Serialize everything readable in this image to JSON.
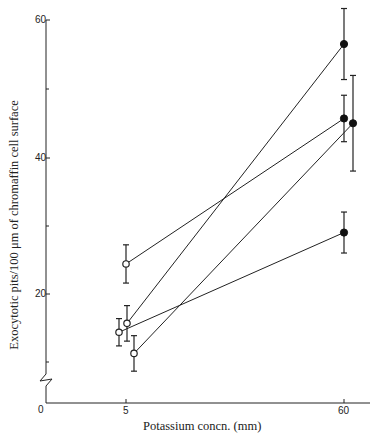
{
  "chart_data": {
    "type": "line",
    "title": "",
    "xlabel": "Potassium concn. (mM)",
    "ylabel": "Exocytotic pits/100 μm of chromaffin cell surface",
    "x_ticks": [
      "5",
      "60"
    ],
    "y_ticks": [
      "0",
      "20",
      "40",
      "60"
    ],
    "y_axis_break": true,
    "ylim": [
      0,
      62
    ],
    "grid": false,
    "legend": null,
    "marker_notes": "open circles at 5 mM, filled circles at 60 mM; vertical error bars",
    "series": [
      {
        "name": "Experiment 1",
        "x": [
          5,
          60
        ],
        "y": [
          24.4,
          56.6
        ],
        "err": [
          2.8,
          5.2
        ]
      },
      {
        "name": "Experiment 2",
        "x": [
          5,
          60
        ],
        "y": [
          14.4,
          45.7
        ],
        "err": [
          2.0,
          3.4
        ]
      },
      {
        "name": "Experiment 3",
        "x": [
          5,
          60
        ],
        "y": [
          15.7,
          29.0
        ],
        "err": [
          2.6,
          3.0
        ]
      },
      {
        "name": "Experiment 4",
        "x": [
          5,
          60
        ],
        "y": [
          11.3,
          45.0
        ],
        "err": [
          2.6,
          7.0
        ]
      }
    ],
    "pairing": [
      {
        "from_5mM": 24.4,
        "to_60mM": 45.7
      },
      {
        "from_5mM": 15.7,
        "to_60mM": 56.6
      },
      {
        "from_5mM": 14.4,
        "to_60mM": 29.0
      },
      {
        "from_5mM": 11.3,
        "to_60mM": 45.0
      }
    ]
  },
  "axes": {
    "x_label": "Potassium concn. (mm)",
    "y_label": "Exocytotic pits/100 μm of chromaffin cell surface",
    "y_tick_0": "0",
    "y_tick_20": "20",
    "y_tick_40": "40",
    "y_tick_60": "60",
    "x_tick_5": "5",
    "x_tick_60": "60"
  }
}
